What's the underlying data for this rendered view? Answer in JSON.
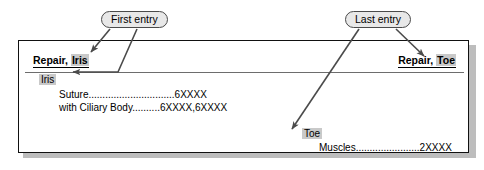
{
  "callouts": {
    "first": "First entry",
    "last": "Last entry"
  },
  "panel": {
    "header": {
      "left_prefix": "Repair, ",
      "left_highlight": "Iris",
      "right_prefix": "Repair, ",
      "right_highlight": "Toe"
    },
    "entries": [
      {
        "term": "Iris",
        "subentries": [
          {
            "label": "Suture",
            "leader": "...............................",
            "codes": "6XXXX"
          },
          {
            "label": "with Ciliary Body",
            "leader": "..........",
            "codes": "6XXXX,6XXXX"
          }
        ]
      },
      {
        "term": "Toe",
        "subentries": [
          {
            "label": "Muscles",
            "leader": ".......................",
            "codes": "2XXXX"
          }
        ]
      }
    ]
  },
  "colors": {
    "highlight": "#c9c9c9",
    "bubble_fill": "#e8e8e8",
    "bubble_border": "#4a4a4a",
    "panel_border": "#111111",
    "panel_shadow": "#bdbdbd",
    "arrow": "#4b4b4b"
  }
}
